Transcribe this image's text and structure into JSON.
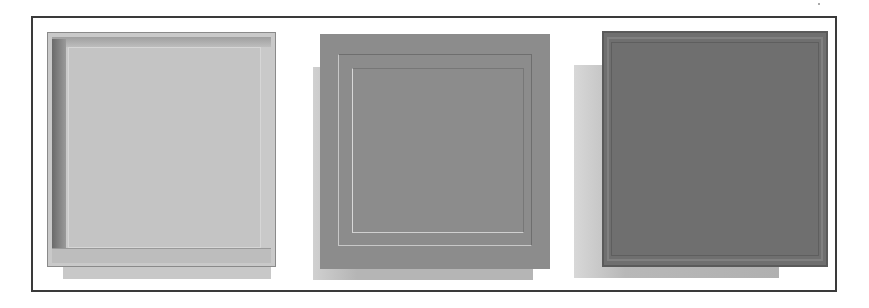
{
  "figure": {
    "panels": [
      {
        "id": "panel-1",
        "style": "light raised beveled panel",
        "color": "#c9c9c9"
      },
      {
        "id": "panel-2",
        "style": "medium gray flat panel with inset rule lines",
        "color": "#8c8c8c"
      },
      {
        "id": "panel-3",
        "style": "dark gray textured panel with trim edge",
        "color": "#6f6f6f"
      }
    ],
    "frame_border_color": "#3a3a3a"
  }
}
